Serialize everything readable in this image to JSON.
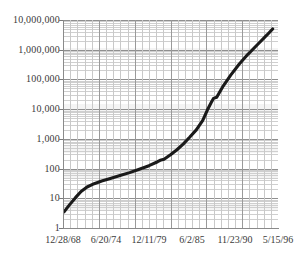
{
  "chart_data": {
    "type": "line",
    "title": "",
    "subtitle": "",
    "xlabel": "",
    "ylabel": "",
    "yscale": "log",
    "ylim": [
      1,
      10000000
    ],
    "grid": true,
    "legend": null,
    "y_ticks": [
      {
        "value": 10000000,
        "label": "10,000,000"
      },
      {
        "value": 1000000,
        "label": "1,000,000"
      },
      {
        "value": 100000,
        "label": "100,000"
      },
      {
        "value": 10000,
        "label": "10,000"
      },
      {
        "value": 1000,
        "label": "1,000"
      },
      {
        "value": 100,
        "label": "100"
      },
      {
        "value": 10,
        "label": "10"
      },
      {
        "value": 1,
        "label": "1"
      }
    ],
    "x_ticks": [
      {
        "position": 0.0,
        "label": "12/28/68"
      },
      {
        "position": 0.2,
        "label": "6/20/74"
      },
      {
        "position": 0.4,
        "label": "12/11/79"
      },
      {
        "position": 0.6,
        "label": "6/2/85"
      },
      {
        "position": 0.8,
        "label": "11/23/90"
      },
      {
        "position": 1.0,
        "label": "5/15/96"
      }
    ],
    "series": [
      {
        "name": "growth",
        "color": "#1a1a1a",
        "x": [
          0.005,
          0.03,
          0.058,
          0.084,
          0.112,
          0.145,
          0.18,
          0.22,
          0.265,
          0.31,
          0.355,
          0.4,
          0.44,
          0.452,
          0.47,
          0.5,
          0.53,
          0.56,
          0.59,
          0.62,
          0.65,
          0.672,
          0.69,
          0.7,
          0.715,
          0.745,
          0.78,
          0.82,
          0.86,
          0.905,
          0.95,
          0.975
        ],
        "y": [
          3.5,
          6.0,
          10.5,
          17.0,
          24.0,
          31.0,
          38.0,
          46.0,
          58.0,
          73.0,
          95.0,
          125.0,
          170.0,
          190.0,
          205.0,
          290.0,
          430.0,
          680.0,
          1150.0,
          2000.0,
          4200.0,
          9500.0,
          17000.0,
          23000.0,
          25000.0,
          60000.0,
          140000.0,
          330000.0,
          700000.0,
          1500000.0,
          3200000.0,
          5000000.0
        ]
      }
    ]
  },
  "plot": {
    "left_px": 63,
    "top_px": 20,
    "width_px": 215,
    "height_px": 208,
    "decades": 7,
    "minor_gridlines": true,
    "vertical_gridline_count": 30,
    "grid_color": "#c9c9c9",
    "grid_major_color": "#8f8f8f",
    "axis_color": "#8a8a8a",
    "background": "#ffffff"
  }
}
